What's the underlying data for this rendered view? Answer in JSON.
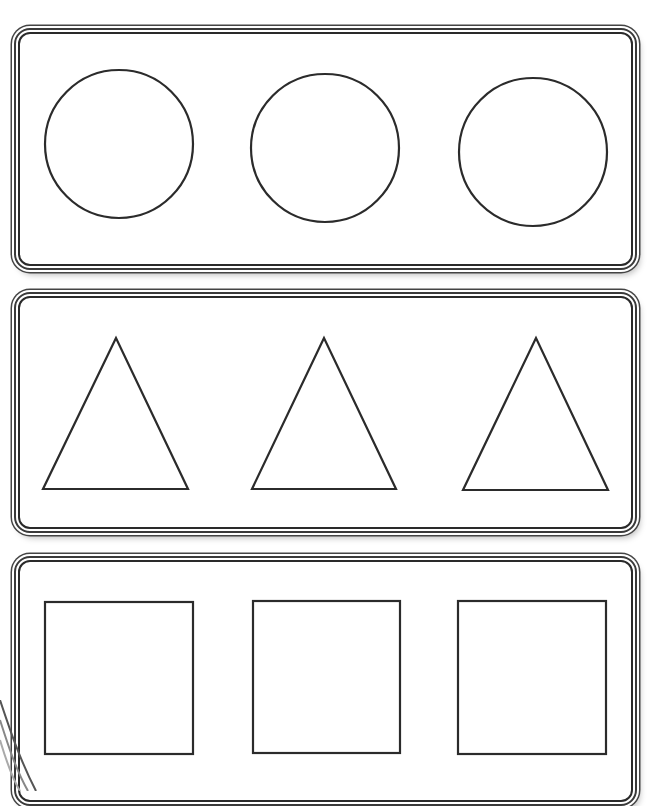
{
  "worksheet": {
    "rows": [
      {
        "name": "circles",
        "shape": "circle",
        "panel": {
          "top": 28,
          "height": 242
        },
        "items": [
          {
            "cx": 119,
            "cy": 144,
            "r": 74
          },
          {
            "cx": 325,
            "cy": 148,
            "r": 74
          },
          {
            "cx": 533,
            "cy": 152,
            "r": 74
          }
        ]
      },
      {
        "name": "triangles",
        "shape": "triangle",
        "panel": {
          "top": 292,
          "height": 241
        },
        "items": [
          {
            "points": "116,338 43,489 188,489"
          },
          {
            "points": "324,338 252,489 396,489"
          },
          {
            "points": "536,338 463,490 608,490"
          }
        ]
      },
      {
        "name": "squares",
        "shape": "square",
        "panel": {
          "top": 556,
          "height": 250
        },
        "items": [
          {
            "x": 45,
            "y": 602,
            "w": 148,
            "h": 152
          },
          {
            "x": 253,
            "y": 601,
            "w": 147,
            "h": 152
          },
          {
            "x": 458,
            "y": 601,
            "w": 148,
            "h": 153
          }
        ]
      }
    ],
    "stroke_color": "#2b2b2b",
    "panel_border_color": "#3a3a3a"
  }
}
